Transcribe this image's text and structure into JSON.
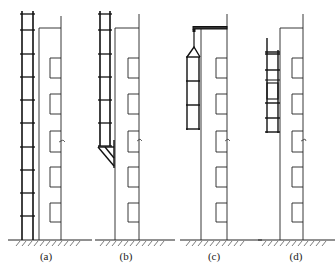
{
  "figure": {
    "colors": {
      "line": "#222222",
      "background": "#ffffff"
    },
    "panels": [
      {
        "id": "a",
        "label": "(a)",
        "arrangement": "full-height ladder scaffold from ground"
      },
      {
        "id": "b",
        "label": "(b)",
        "arrangement": "cantilevered ladder scaffold on triangular bracket"
      },
      {
        "id": "c",
        "label": "(c)",
        "arrangement": "suspended cage hung from roof outrigger"
      },
      {
        "id": "d",
        "label": "(d)",
        "arrangement": "attached climbing ladder frame on wall"
      }
    ]
  }
}
